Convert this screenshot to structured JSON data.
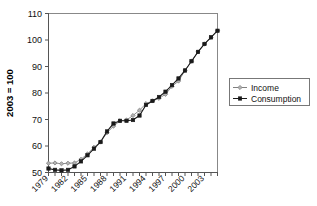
{
  "chart_data": {
    "type": "line",
    "title": "",
    "xlabel": "",
    "ylabel": "2003 = 100",
    "ylim": [
      50,
      110
    ],
    "yticks": [
      50,
      60,
      70,
      80,
      90,
      100,
      110
    ],
    "xlim": [
      1979,
      2005
    ],
    "xticks": [
      1979,
      1982,
      1985,
      1988,
      1991,
      1994,
      1997,
      2000,
      2003
    ],
    "xtick_rotation": 45,
    "grid": false,
    "legend_position": "right",
    "x": [
      1979,
      1980,
      1981,
      1982,
      1983,
      1984,
      1985,
      1986,
      1987,
      1988,
      1989,
      1990,
      1991,
      1992,
      1993,
      1994,
      1995,
      1996,
      1997,
      1998,
      1999,
      2000,
      2001,
      2002,
      2003,
      2004,
      2005
    ],
    "series": [
      {
        "name": "Income",
        "marker": "diamond",
        "color": "#808080",
        "values": [
          53.5,
          53.6,
          53.3,
          53.5,
          53.6,
          55.0,
          57.0,
          59.5,
          61.5,
          65.0,
          67.5,
          69.5,
          69.8,
          71.5,
          73.5,
          76.0,
          77.0,
          78.0,
          79.5,
          82.5,
          84.5,
          88.5,
          92.0,
          95.5,
          98.5,
          101.0,
          103.5
        ]
      },
      {
        "name": "Consumption",
        "marker": "square",
        "color": "#1a1a1a",
        "values": [
          51.5,
          51.0,
          50.8,
          51.0,
          52.3,
          54.2,
          56.5,
          59.0,
          61.5,
          65.5,
          68.5,
          69.5,
          69.5,
          69.8,
          71.5,
          75.5,
          77.0,
          78.5,
          80.5,
          83.0,
          85.5,
          88.5,
          92.0,
          95.5,
          98.5,
          101.0,
          103.5
        ]
      }
    ],
    "legend": [
      "Income",
      "Consumption"
    ]
  }
}
